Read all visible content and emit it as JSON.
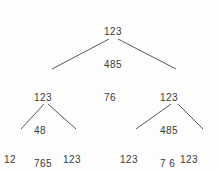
{
  "diagram": {
    "type": "tree",
    "background_color": "#fdfdfd",
    "text_color": "#3a3a3a",
    "edge_color": "#5a5a5a",
    "nodes": [
      {
        "id": "root",
        "name": "root-node",
        "level": 0,
        "x": 104,
        "y": 4,
        "rows": [
          "123",
          "485",
          "76 "
        ],
        "row1": "123",
        "row2": "485",
        "row3": "76 "
      },
      {
        "id": "n-left",
        "name": "level1-left-node",
        "level": 1,
        "x": 34,
        "y": 70,
        "rows": [
          "123",
          "48 ",
          "765"
        ],
        "row1": "123",
        "row2": "48 ",
        "row3": "765"
      },
      {
        "id": "n-right",
        "name": "level1-right-node",
        "level": 1,
        "x": 160,
        "y": 70,
        "rows": [
          "123",
          "485",
          "7 6"
        ],
        "row1": "123",
        "row2": "485",
        "row3": "7 6"
      },
      {
        "id": "l1",
        "name": "leaf-node-1",
        "level": 2,
        "x": 4,
        "y": 132,
        "rows": [
          "12 ",
          "483",
          "765"
        ],
        "row1": "12 ",
        "row2": "483",
        "row3": "765"
      },
      {
        "id": "l2",
        "name": "leaf-node-2",
        "level": 2,
        "x": 63,
        "y": 132,
        "rows": [
          "123",
          "4 8",
          " 76"
        ],
        "row1": "123",
        "row2": "4 8",
        "row3": " 76"
      },
      {
        "id": "l3",
        "name": "leaf-node-3",
        "level": 2,
        "x": 120,
        "y": 132,
        "rows": [
          "123",
          "485",
          " 76"
        ],
        "row1": "123",
        "row2": "485",
        "row3": " 76"
      },
      {
        "id": "l4",
        "name": "leaf-node-4",
        "level": 2,
        "x": 180,
        "y": 132,
        "rows": [
          "123",
          "485",
          "76 "
        ],
        "row1": "123",
        "row2": "485",
        "row3": "76 "
      }
    ],
    "edges": [
      {
        "id": "e-root-left",
        "name": "edge-root-to-left",
        "from": "root",
        "to": "n-left",
        "x1": 109,
        "y1": 39,
        "x2": 52,
        "y2": 69
      },
      {
        "id": "e-root-right",
        "name": "edge-root-to-right",
        "from": "root",
        "to": "n-right",
        "x1": 118,
        "y1": 39,
        "x2": 176,
        "y2": 69
      },
      {
        "id": "e-left-l1",
        "name": "edge-left-to-leaf1",
        "from": "n-left",
        "to": "l1",
        "x1": 44,
        "y1": 104,
        "x2": 21,
        "y2": 129
      },
      {
        "id": "e-left-l2",
        "name": "edge-left-to-leaf2",
        "from": "n-left",
        "to": "l2",
        "x1": 48,
        "y1": 104,
        "x2": 76,
        "y2": 129
      },
      {
        "id": "e-right-l3",
        "name": "edge-right-to-leaf3",
        "from": "n-right",
        "to": "l3",
        "x1": 171,
        "y1": 104,
        "x2": 136,
        "y2": 129
      },
      {
        "id": "e-right-l4",
        "name": "edge-right-to-leaf4",
        "from": "n-right",
        "to": "l4",
        "x1": 178,
        "y1": 104,
        "x2": 203,
        "y2": 129
      }
    ]
  }
}
